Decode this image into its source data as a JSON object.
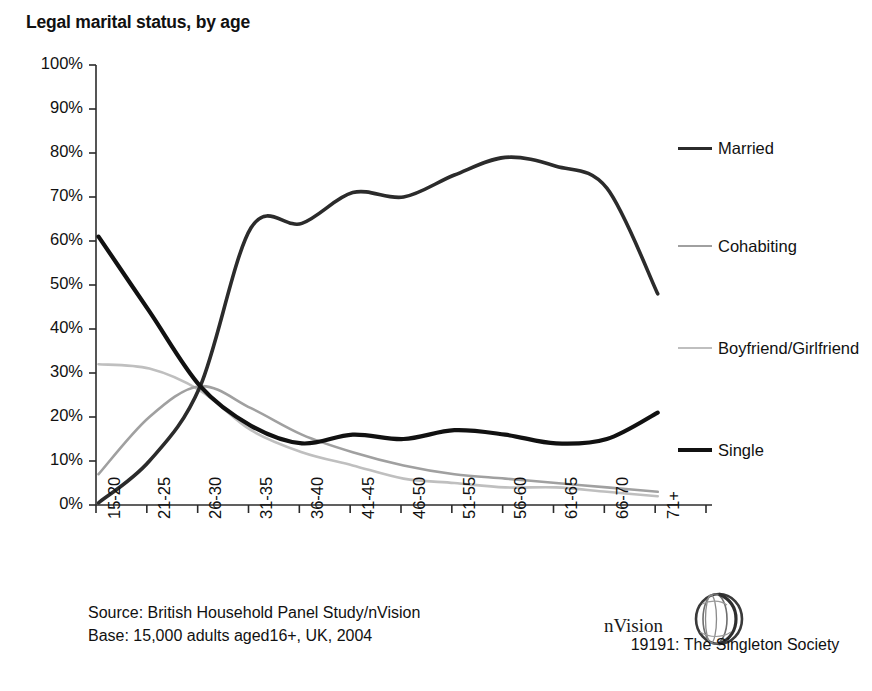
{
  "title": "Legal marital status, by age",
  "colors": {
    "married": "#2b2b2b",
    "cohabiting": "#a0a0a0",
    "boyfriend_girlfriend": "#bfbfbf",
    "single": "#111111",
    "axis": "#2b2b2b",
    "text": "#111111"
  },
  "legend": {
    "position": "right",
    "items": [
      {
        "label": "Married",
        "color": "#2b2b2b",
        "width": 3.6
      },
      {
        "label": "Cohabiting",
        "color": "#a0a0a0",
        "width": 2.6
      },
      {
        "label": "Boyfriend/Girlfriend",
        "color": "#bfbfbf",
        "width": 2.6
      },
      {
        "label": "Single",
        "color": "#111111",
        "width": 4.2
      }
    ]
  },
  "source": {
    "line1": "Source: British Household Panel Study/nVision",
    "line2": "Base: 15,000 adults aged16+, UK, 2004"
  },
  "brand": {
    "name": "nVision",
    "caption": "19191: The Singleton Society",
    "mark": "nvision-sphere-logo"
  },
  "chart_data": {
    "type": "line",
    "title": "Legal marital status, by age",
    "xlabel": "",
    "ylabel": "",
    "ylim": [
      0,
      100
    ],
    "yticks": [
      0,
      10,
      20,
      30,
      40,
      50,
      60,
      70,
      80,
      90,
      100
    ],
    "ytick_labels": [
      "0%",
      "10%",
      "20%",
      "30%",
      "40%",
      "50%",
      "60%",
      "70%",
      "80%",
      "90%",
      "100%"
    ],
    "grid": false,
    "legend_position": "right",
    "categories": [
      "15-20",
      "21-25",
      "26-30",
      "31-35",
      "36-40",
      "41-45",
      "46-50",
      "51-55",
      "56-60",
      "61-65",
      "66-70",
      "71+"
    ],
    "series": [
      {
        "name": "Married",
        "color": "#2b2b2b",
        "values": [
          0.5,
          10,
          27,
          63,
          64,
          71,
          70,
          75,
          79,
          77,
          72,
          48
        ]
      },
      {
        "name": "Cohabiting",
        "color": "#a0a0a0",
        "values": [
          7,
          20,
          27,
          22,
          16,
          12,
          9,
          7,
          6,
          5,
          4,
          3
        ]
      },
      {
        "name": "Boyfriend/Girlfriend",
        "color": "#bfbfbf",
        "values": [
          32,
          31,
          26,
          17,
          12,
          9,
          6,
          5,
          4,
          4,
          3,
          2
        ]
      },
      {
        "name": "Single",
        "color": "#111111",
        "values": [
          61,
          44,
          27,
          18,
          14,
          16,
          15,
          17,
          16,
          14,
          15,
          21
        ]
      }
    ]
  }
}
